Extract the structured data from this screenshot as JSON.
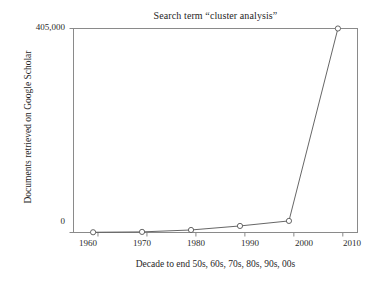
{
  "chart_data": {
    "type": "line",
    "title": "Search term “cluster analysis”",
    "xlabel": "Decade to end 50s, 60s, 70s, 80s, 90s, 00s",
    "ylabel": "Documents retrieved on Google Scholar",
    "x": [
      1959,
      1969,
      1979,
      1989,
      1999,
      2009
    ],
    "values": [
      500,
      1200,
      5000,
      13000,
      23000,
      405000
    ],
    "categories": [
      "1959",
      "1969",
      "1979",
      "1989",
      "1999",
      "2009"
    ],
    "xticks": [
      "1960",
      "1970",
      "1980",
      "1990",
      "2000",
      "2010"
    ],
    "xtick_values": [
      1960,
      1970,
      1980,
      1990,
      2000,
      2010
    ],
    "yticks": [
      "0",
      "405,000"
    ],
    "ytick_values": [
      0,
      405000
    ],
    "xlim": [
      1955,
      2013
    ],
    "ylim": [
      0,
      405000
    ],
    "grid": false,
    "legend": null,
    "marker": "open-circle",
    "line_color": "#555555",
    "marker_color": "#555555",
    "frame_color": "#8a8a8a",
    "background": "#ffffff"
  },
  "axis": {
    "ytick_top_label": "405,000",
    "ytick_bottom_label": "0",
    "xtick_labels": [
      "1960",
      "1970",
      "1980",
      "1990",
      "2000",
      "2010"
    ]
  }
}
